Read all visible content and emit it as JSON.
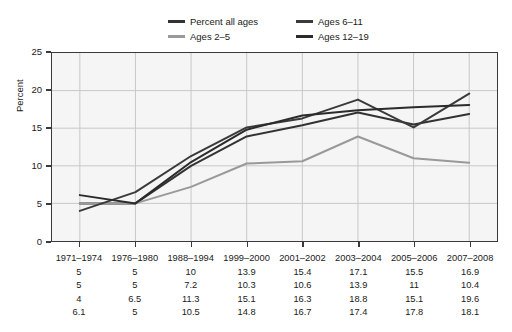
{
  "chart_data": {
    "type": "line",
    "title": "",
    "xlabel": "",
    "ylabel": "Percent",
    "ylim": [
      0,
      25
    ],
    "yticks": [
      0,
      5,
      10,
      15,
      20,
      25
    ],
    "grid": true,
    "legend_position": "top-center",
    "categories": [
      "1971–1974",
      "1976–1980",
      "1988–1994",
      "1999–2000",
      "2001–2002",
      "2003–2004",
      "2005–2006",
      "2007–2008"
    ],
    "series": [
      {
        "name": "Percent all ages",
        "color": "#333333",
        "values": [
          5,
          5,
          10,
          13.9,
          15.4,
          17.1,
          15.5,
          16.9
        ]
      },
      {
        "name": "Ages 2–5",
        "color": "#999999",
        "values": [
          5,
          5,
          7.2,
          10.3,
          10.6,
          13.9,
          11,
          10.4
        ]
      },
      {
        "name": "Ages 6–11",
        "color": "#3a3a3a",
        "values": [
          4,
          6.5,
          11.3,
          15.1,
          16.3,
          18.8,
          15.1,
          19.6
        ]
      },
      {
        "name": "Ages 12–19",
        "color": "#2b2b2b",
        "values": [
          6.1,
          5,
          10.5,
          14.8,
          16.7,
          17.4,
          17.8,
          18.1
        ]
      }
    ]
  },
  "legend": {
    "items": [
      {
        "label": "Percent all ages",
        "color": "#333333"
      },
      {
        "label": "Ages 6–11",
        "color": "#3a3a3a"
      },
      {
        "label": "Ages 2–5",
        "color": "#999999"
      },
      {
        "label": "Ages 12–19",
        "color": "#2b2b2b"
      }
    ]
  },
  "axis": {
    "y_title": "Percent",
    "y_labels": [
      "25",
      "20",
      "15",
      "10",
      "5",
      "0"
    ]
  },
  "table": {
    "rows": [
      [
        "1971–1974",
        "1976–1980",
        "1988–1994",
        "1999–2000",
        "2001–2002",
        "2003–2004",
        "2005–2006",
        "2007–2008"
      ],
      [
        "5",
        "5",
        "10",
        "13.9",
        "15.4",
        "17.1",
        "15.5",
        "16.9"
      ],
      [
        "5",
        "5",
        "7.2",
        "10.3",
        "10.6",
        "13.9",
        "11",
        "10.4"
      ],
      [
        "4",
        "6.5",
        "11.3",
        "15.1",
        "16.3",
        "18.8",
        "15.1",
        "19.6"
      ],
      [
        "6.1",
        "5",
        "10.5",
        "14.8",
        "16.7",
        "17.4",
        "17.8",
        "18.1"
      ]
    ]
  },
  "style": {
    "plot_bg": "#f5f5f5",
    "grid_color": "#c8c8c8",
    "frame_color": "#3a3a3a"
  }
}
